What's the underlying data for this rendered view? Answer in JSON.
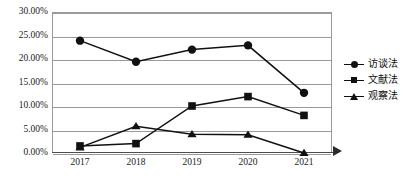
{
  "chart_data": {
    "type": "line",
    "title": "",
    "subtitle": "",
    "xlabel": "",
    "ylabel": "",
    "categories": [
      "2017",
      "2018",
      "2019",
      "2020",
      "2021"
    ],
    "ylim": [
      0,
      30
    ],
    "ytick_values": [
      0,
      5,
      10,
      15,
      20,
      25,
      30
    ],
    "ytick_labels": [
      "0.00%",
      "5.00%",
      "10.00%",
      "15.00%",
      "20.00%",
      "25.00%",
      "30.00%"
    ],
    "grid": true,
    "grid_axis": "y",
    "legend_position": "right",
    "series": [
      {
        "name": "访谈法",
        "marker": "circle",
        "color": "#111111",
        "values": [
          23.9,
          19.4,
          22.0,
          22.9,
          12.8
        ]
      },
      {
        "name": "文献法",
        "marker": "square",
        "color": "#111111",
        "values": [
          1.5,
          2.0,
          10.0,
          12.0,
          8.0
        ]
      },
      {
        "name": "观察法",
        "marker": "triangle",
        "color": "#111111",
        "values": [
          1.2,
          5.7,
          4.0,
          3.9,
          0.0
        ]
      }
    ]
  },
  "legend": {
    "items": [
      {
        "label": "访谈法",
        "marker": "circle"
      },
      {
        "label": "文献法",
        "marker": "square"
      },
      {
        "label": "观察法",
        "marker": "triangle"
      }
    ]
  },
  "colors": {
    "series": "#111111",
    "grid": "#9a9a9a",
    "axis": "#4d4d4d",
    "text": "#1a1a1a",
    "background": "#ffffff"
  }
}
